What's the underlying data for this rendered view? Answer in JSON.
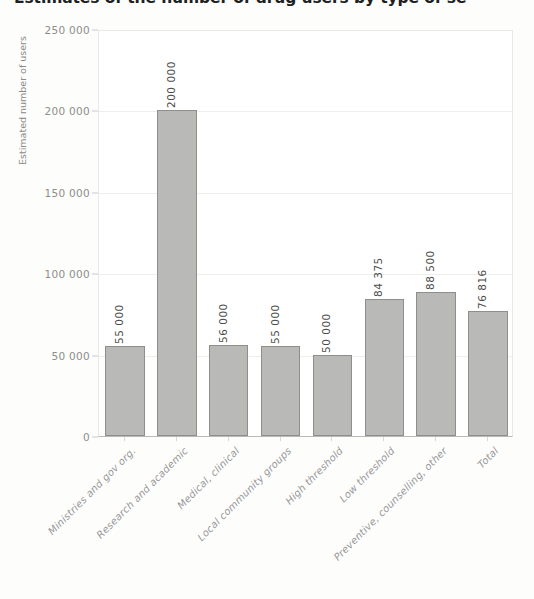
{
  "chart_data": {
    "type": "bar",
    "title": "Estimates of the number of drug users by type of se",
    "subtitle": "",
    "xlabel": "",
    "ylabel": "Estimated number of users",
    "ylim": [
      0,
      250000
    ],
    "grid": true,
    "legend": "none",
    "ytick_labels": [
      "250 000",
      "200 000",
      "150 000",
      "100 000",
      "50 000",
      "0"
    ],
    "ytick_values": [
      250000,
      200000,
      150000,
      100000,
      50000,
      0
    ],
    "categories": [
      "Ministries and gov org.",
      "Research and academic",
      "Medical, clinical",
      "Local community groups",
      "High threshold",
      "Low threshold",
      "Preventive, counselling, other",
      "Total"
    ],
    "values": [
      55000,
      200000,
      56000,
      55000,
      50000,
      84375,
      88500,
      76816
    ],
    "value_labels": [
      "55 000",
      "200 000",
      "56 000",
      "55 000",
      "50 000",
      "84 375",
      "88 500",
      "76 816"
    ],
    "bar_color": "#b9b9b7",
    "bar_border_color": "#8e8e8b",
    "grid_color": "#eeeeec",
    "axis_color": "#b9b9b6",
    "text_color": "#8d8d8b"
  }
}
